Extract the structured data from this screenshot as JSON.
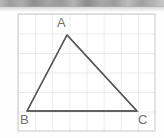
{
  "figure": {
    "kind": "geometry-diagram",
    "background_color": "#fefefe",
    "top_band": {
      "name": "top-noise-band",
      "color": "#a5a5a5",
      "height_px": 7
    },
    "grid": {
      "color": "#d8d8d8",
      "border_color": "#c9c9c9",
      "x_start": 18,
      "y_start": 14,
      "x_end": 155,
      "y_end": 131,
      "columns": 8,
      "rows": 6,
      "cell_width": 17.125,
      "cell_height": 19.5,
      "visible": true
    },
    "shape": {
      "name": "triangle-ABC",
      "stroke_color": "#585858",
      "stroke_width": 1.4,
      "fill": "none",
      "vertices": [
        {
          "label": "A",
          "x": 67,
          "y": 35
        },
        {
          "label": "B",
          "x": 27,
          "y": 111
        },
        {
          "label": "C",
          "x": 137,
          "y": 111
        }
      ],
      "edges": [
        {
          "from": "A",
          "to": "B"
        },
        {
          "from": "B",
          "to": "C"
        },
        {
          "from": "C",
          "to": "A"
        }
      ]
    },
    "labels": {
      "a": "A",
      "b": "B",
      "c": "C",
      "color": "#6f6f6f",
      "font_size_px": 13
    }
  }
}
